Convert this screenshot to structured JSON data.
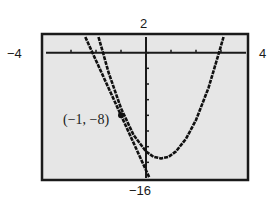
{
  "chart_data": {
    "type": "line",
    "title": "",
    "xlabel": "",
    "ylabel": "",
    "xlim": [
      -4,
      4
    ],
    "ylim": [
      -16,
      2
    ],
    "window_labels": {
      "xmin": "−4",
      "xmax": "4",
      "ymin": "−16",
      "ymax": "2"
    },
    "grid": false,
    "x_ticks": [
      -3,
      -2,
      -1,
      0,
      1,
      2,
      3
    ],
    "y_ticks": [
      -14,
      -12,
      -10,
      -8,
      -6,
      -4,
      -2,
      0
    ],
    "series": [
      {
        "name": "parabola",
        "x": [
          -1.9,
          -1.72,
          -1.5,
          -1.0,
          -0.5,
          0.0,
          0.3,
          0.6,
          0.9,
          1.2,
          1.6,
          2.0,
          2.5,
          2.92,
          3.1
        ],
        "values": [
          2.0,
          0.0,
          -2.5,
          -7.1,
          -10.5,
          -12.6,
          -13.3,
          -13.5,
          -13.3,
          -12.6,
          -11.0,
          -8.6,
          -4.5,
          0.0,
          2.0
        ]
      },
      {
        "name": "tangent line",
        "x": [
          -2.43,
          -2.0,
          -1.0,
          0.0,
          0.14
        ],
        "values": [
          2.0,
          -1.0,
          -8.0,
          -15.0,
          -16.0
        ]
      }
    ],
    "annotations": [
      {
        "text": "(−1, −8)",
        "x": -1,
        "y": -8,
        "marker": "point"
      }
    ]
  }
}
